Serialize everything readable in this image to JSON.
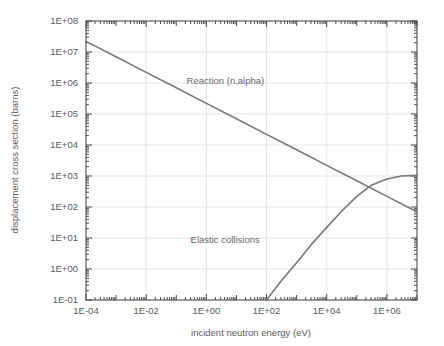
{
  "chart_data": {
    "type": "line",
    "title": "",
    "xlabel": "incident neutron energy  (eV)",
    "ylabel": "displacement cross section  (barns)",
    "xscale": "log",
    "yscale": "log",
    "xlim": [
      0.0001,
      10000000.0
    ],
    "ylim": [
      0.1,
      100000000.0
    ],
    "grid": true,
    "legend_position": "inline-annotation",
    "xticklabels": [
      "1E-04",
      "1E-02",
      "1E+00",
      "1E+02",
      "1E+04",
      "1E+06"
    ],
    "xtickvalues": [
      0.0001,
      0.01,
      1.0,
      100.0,
      10000.0,
      1000000.0
    ],
    "yticklabels": [
      "1E+08",
      "1E+07",
      "1E+06",
      "1E+05",
      "1E+04",
      "1E+03",
      "1E+02",
      "1E+01",
      "1E+00",
      "1E-01"
    ],
    "ytickvalues": [
      100000000.0,
      10000000.0,
      1000000.0,
      100000.0,
      10000.0,
      1000.0,
      100.0,
      10.0,
      1.0,
      0.1
    ],
    "annotations": [
      {
        "text": "Reaction (n,alpha)",
        "x": 0.22,
        "y": 900000.0
      },
      {
        "text": "Elastic collisions",
        "x": 0.3,
        "y": 7.0
      }
    ],
    "series": [
      {
        "name": "Reaction (n,alpha)",
        "color": "#787878",
        "points": [
          [
            0.0001,
            22000000.0
          ],
          [
            0.001,
            7000000.0
          ],
          [
            0.01,
            2200000.0
          ],
          [
            0.1,
            700000.0
          ],
          [
            1.0,
            220000.0
          ],
          [
            10.0,
            70000.0
          ],
          [
            100.0,
            22000.0
          ],
          [
            1000.0,
            7000.0
          ],
          [
            10000.0,
            2200.0
          ],
          [
            100000.0,
            700.0
          ],
          [
            1000000.0,
            220.0
          ],
          [
            10000000.0,
            70.0
          ]
        ]
      },
      {
        "name": "Elastic collisions",
        "color": "#787878",
        "points": [
          [
            100.0,
            0.1
          ],
          [
            300.0,
            0.4
          ],
          [
            1000.0,
            1.6
          ],
          [
            3000.0,
            6.0
          ],
          [
            10000.0,
            22.0
          ],
          [
            30000.0,
            70.0
          ],
          [
            100000.0,
            220.0
          ],
          [
            300000.0,
            500.0
          ],
          [
            1000000.0,
            800.0
          ],
          [
            3000000.0,
            1000.0
          ],
          [
            10000000.0,
            1050.0
          ]
        ]
      }
    ]
  },
  "axes": {
    "x_title": "incident neutron energy  (eV)",
    "y_title": "displacement cross section  (barns)"
  }
}
